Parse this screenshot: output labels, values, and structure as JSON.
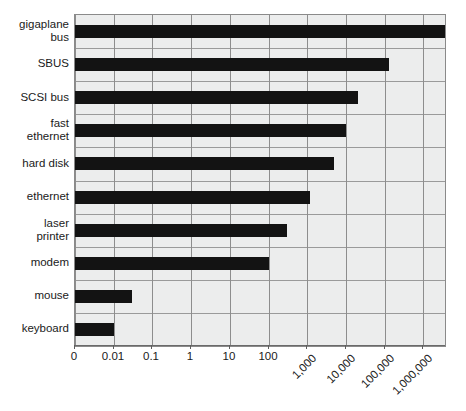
{
  "chart_data": {
    "type": "bar",
    "orientation": "horizontal",
    "title": "",
    "subtitle": "",
    "xlabel": "",
    "ylabel": "",
    "scale": "log",
    "grid": true,
    "legend": null,
    "categories": [
      "gigaplane\nbus",
      "SBUS",
      "SCSI bus",
      "fast\nethernet",
      "hard disk",
      "ethernet",
      "laser\nprinter",
      "modem",
      "mouse",
      "keyboard"
    ],
    "values": [
      4000000,
      130000,
      20000,
      10000,
      5000,
      1200,
      300,
      100,
      0.03,
      0.01
    ],
    "xticks": [
      "0",
      "0.01",
      "0.1",
      "1",
      "10",
      "100",
      "1,000",
      "10,000",
      "100,000",
      "1,000,000"
    ],
    "xtick_values": [
      0,
      0.01,
      0.1,
      1,
      10,
      100,
      1000,
      10000,
      100000,
      1000000
    ],
    "xlim": [
      0,
      4000000
    ],
    "bar_color": "#131313",
    "plot_background": "#eceded",
    "grid_color": "#8d8d8d"
  },
  "layout": {
    "plot_left": 74,
    "plot_top": 14,
    "plot_width": 370,
    "plot_height": 331,
    "decade_px": 38.7,
    "rotated_tick_start_index": 6
  }
}
